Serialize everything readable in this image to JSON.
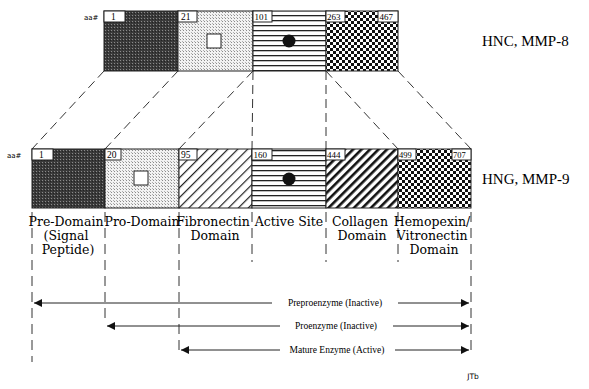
{
  "top_bar": {
    "aa_label": "aa#",
    "title": "HNC, MMP-8",
    "segments": [
      {
        "start": "1",
        "pattern": "dark-dots",
        "marker": ""
      },
      {
        "start": "21",
        "pattern": "light-dots",
        "marker": "square"
      },
      {
        "start": "101",
        "pattern": "horizontal-lines",
        "marker": "circle"
      },
      {
        "start": "263",
        "end": "467",
        "pattern": "checker",
        "marker": ""
      }
    ]
  },
  "bottom_bar": {
    "aa_label": "aa#",
    "title": "HNG, MMP-9",
    "segments": [
      {
        "start": "1",
        "pattern": "dark-dots",
        "marker": ""
      },
      {
        "start": "20",
        "pattern": "light-dots",
        "marker": "square"
      },
      {
        "start": "95",
        "pattern": "diagonal-thin",
        "marker": ""
      },
      {
        "start": "160",
        "pattern": "horizontal-lines",
        "marker": "circle"
      },
      {
        "start": "444",
        "pattern": "diagonal-thick",
        "marker": ""
      },
      {
        "start": "499",
        "end": "707",
        "pattern": "checker",
        "marker": ""
      }
    ]
  },
  "domains": [
    {
      "lines": [
        "Pre-Domain",
        "(Signal",
        "Peptide)"
      ]
    },
    {
      "lines": [
        "Pro-Domain"
      ]
    },
    {
      "lines": [
        "Fibronectin",
        "Domain"
      ]
    },
    {
      "lines": [
        "Active Site"
      ]
    },
    {
      "lines": [
        "Collagen",
        "Domain"
      ]
    },
    {
      "lines": [
        "Hemopexin/",
        "Vitronectin",
        "Domain"
      ]
    }
  ],
  "ranges": [
    {
      "label": "Preproenzyme (Inactive)"
    },
    {
      "label": "Proenzyme (Inactive)"
    },
    {
      "label": "Mature Enzyme (Active)"
    }
  ],
  "signature": "JTb"
}
